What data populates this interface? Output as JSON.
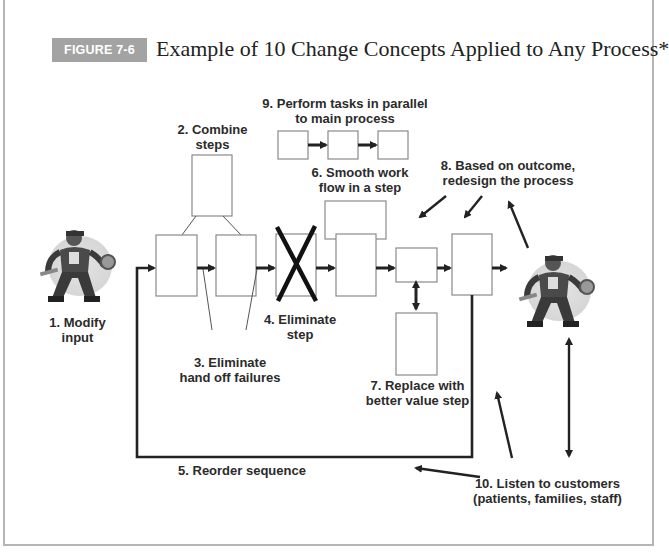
{
  "figure": {
    "badge": "FIGURE 7-6",
    "title": "Example of 10 Change Concepts Applied to Any Process*",
    "badge_color": "#a3a3a3"
  },
  "labels": {
    "modify_input": [
      "1. Modify",
      "input"
    ],
    "combine_steps": [
      "2. Combine",
      "steps"
    ],
    "eliminate_handoff": [
      "3. Eliminate",
      "hand off failures"
    ],
    "eliminate_step": [
      "4. Eliminate",
      "step"
    ],
    "reorder": "5. Reorder sequence",
    "smooth_flow": [
      "6. Smooth work",
      "flow in a step"
    ],
    "replace_step": [
      "7. Replace with",
      "better value step"
    ],
    "redesign": [
      "8. Based on outcome,",
      "redesign the process"
    ],
    "parallel": [
      "9. Perform tasks in parallel",
      "to main process"
    ],
    "listen": [
      "10. Listen to customers",
      "(patients, families, staff)"
    ]
  },
  "icons": {
    "left_figure": "mechanic-worker-icon",
    "right_figure": "mechanic-worker-icon"
  },
  "colors": {
    "box_stroke": "#8a8a8a",
    "arrow": "#222222",
    "text": "#2b2b2b"
  }
}
